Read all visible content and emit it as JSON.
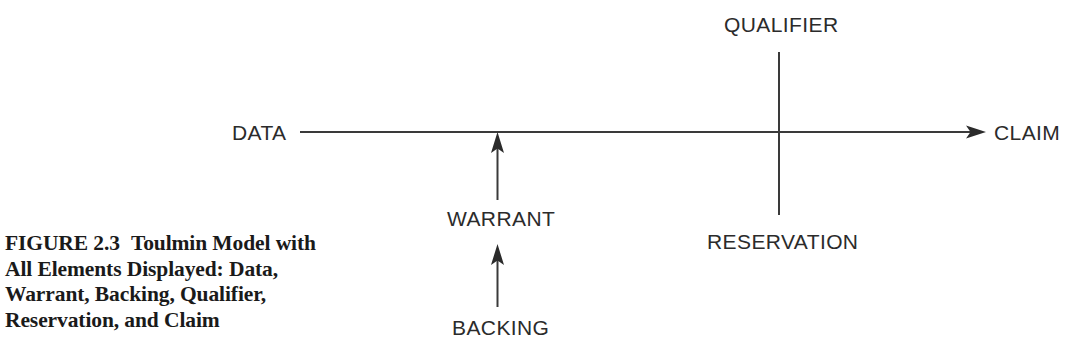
{
  "figure": {
    "caption_label": "FIGURE 2.3",
    "caption_lines": [
      "Toulmin Model with",
      "All Elements Displayed: Data,",
      "Warrant, Backing, Qualifier,",
      "Reservation, and Claim"
    ],
    "caption_full": "FIGURE 2.3   Toulmin Model with All Elements Displayed: Data, Warrant, Backing, Qualifier, Reservation, and Claim"
  },
  "diagram": {
    "type": "toulmin-argument-model",
    "background_color": "#ffffff",
    "line_color": "#3a3a3a",
    "text_color": "#2b2b2b",
    "nodes": {
      "data": "DATA",
      "claim": "CLAIM",
      "warrant": "WARRANT",
      "backing": "BACKING",
      "qualifier": "QUALIFIER",
      "reservation": "RESERVATION"
    },
    "connectors": [
      {
        "name": "data-to-claim",
        "from": "DATA",
        "to": "CLAIM",
        "orientation": "horizontal",
        "arrowhead": "end"
      },
      {
        "name": "warrant-to-main",
        "from": "WARRANT",
        "to": "data-to-claim line",
        "orientation": "vertical-up",
        "arrowhead": "end"
      },
      {
        "name": "backing-to-warrant",
        "from": "BACKING",
        "to": "WARRANT",
        "orientation": "vertical-up",
        "arrowhead": "end"
      },
      {
        "name": "qualifier-reservation-axis",
        "from": "QUALIFIER",
        "to": "RESERVATION",
        "orientation": "vertical",
        "arrowhead": "none"
      }
    ]
  }
}
